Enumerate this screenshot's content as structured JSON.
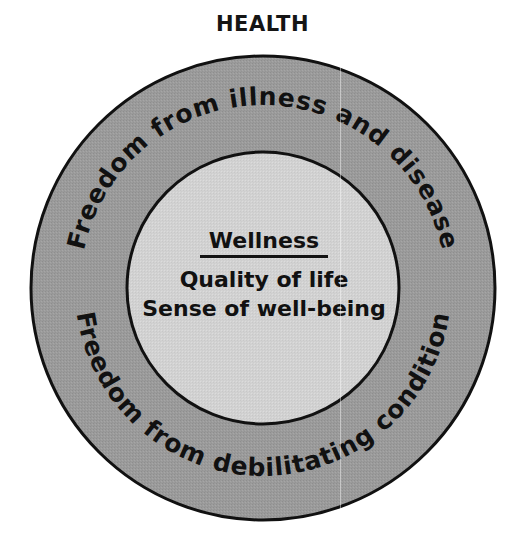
{
  "title": "HEALTH",
  "diagram": {
    "type": "concentric-circles",
    "outer_ring": {
      "top_arc_label": "Freedom from illness and disease",
      "bottom_arc_label": "Freedom from debilitating condition",
      "fill_color": "#9b9b9b",
      "stroke_color": "#111111"
    },
    "inner_circle": {
      "heading": "Wellness",
      "lines": [
        "Quality of life",
        "Sense of well-being"
      ],
      "fill_color": "#d2d2d2",
      "stroke_color": "#111111"
    },
    "background_color": "#ffffff"
  }
}
